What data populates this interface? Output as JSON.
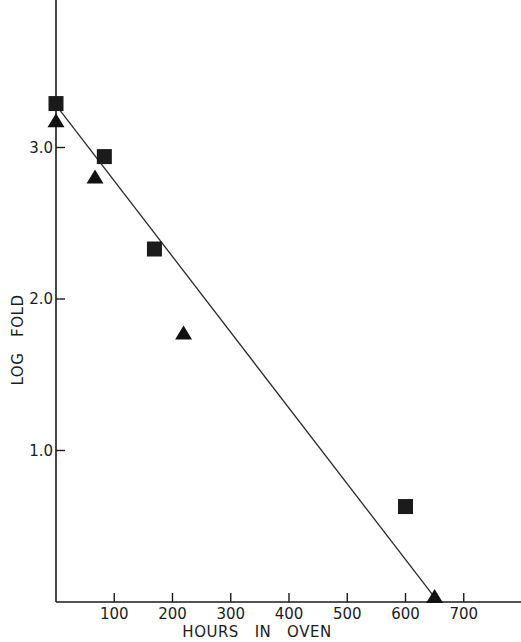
{
  "chart_data": {
    "type": "scatter",
    "title": "",
    "xlabel": "HOURS   IN   OVEN",
    "ylabel": "LOG   FOLD",
    "xlim": [
      0,
      790
    ],
    "ylim": [
      0,
      3.9
    ],
    "grid": false,
    "legend": null,
    "x_ticks": [
      100,
      200,
      300,
      400,
      500,
      600,
      700
    ],
    "x_tick_labels": [
      "100",
      "200",
      "300",
      "400",
      "500",
      "600",
      "700"
    ],
    "y_ticks": [
      1.0,
      2.0,
      3.0
    ],
    "y_tick_labels": [
      "1.0",
      "2.0",
      "3.0"
    ],
    "series": [
      {
        "name": "squares",
        "marker": "square",
        "points": [
          {
            "x": 0,
            "y": 3.29
          },
          {
            "x": 83,
            "y": 2.94
          },
          {
            "x": 169,
            "y": 2.33
          },
          {
            "x": 600,
            "y": 0.63
          }
        ]
      },
      {
        "name": "triangles",
        "marker": "triangle",
        "points": [
          {
            "x": 0,
            "y": 3.17
          },
          {
            "x": 67,
            "y": 2.8
          },
          {
            "x": 219,
            "y": 1.77
          },
          {
            "x": 650,
            "y": 0.03
          }
        ]
      }
    ],
    "fit_line": {
      "x0": 0,
      "y0": 3.28,
      "x1": 650,
      "y1": 0.03
    }
  },
  "layout": {
    "origin_px": [
      56,
      602
    ],
    "px_per_x_unit": 0.5825,
    "px_per_y_unit": 151.5,
    "x_axis_end_px": 521,
    "y_axis_top_px": 0
  }
}
